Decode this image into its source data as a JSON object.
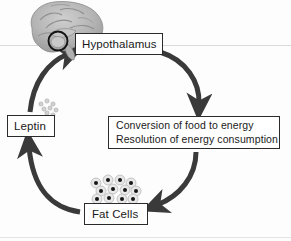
{
  "figure": {
    "credit": "© Cengage Learning"
  },
  "nodes": {
    "hypothalamus": {
      "label": "Hypothalamus"
    },
    "conversion": {
      "line1": "Conversion of food to energy",
      "line2": "Resolution of energy consumption"
    },
    "leptin": {
      "label": "Leptin"
    },
    "fat_cells": {
      "label": "Fat Cells"
    }
  },
  "illustrations": {
    "brain": "brain-sagittal-illustration",
    "hypothalamus_highlight": "circle-highlight-icon",
    "leptin_molecules": "leptin-dots-icon",
    "fat_cell_cluster": "fat-cells-cluster-icon"
  },
  "arrows": [
    {
      "id": "hypothalamus-to-conversion",
      "from": "Hypothalamus",
      "to": "Conversion of food to energy"
    },
    {
      "id": "conversion-to-fat-cells",
      "from": "Conversion of food to energy",
      "to": "Fat Cells"
    },
    {
      "id": "fat-cells-to-leptin",
      "from": "Fat Cells",
      "to": "Leptin"
    },
    {
      "id": "leptin-to-hypothalamus",
      "from": "Leptin",
      "to": "Hypothalamus"
    }
  ],
  "colors": {
    "arrow": "#3a3a3a",
    "box_border": "#2b2b2b",
    "text": "#1a1a1a",
    "credit_text": "#8c8c8c",
    "rule": "#d9d9d9",
    "fat_cell_fill": "#e8e8e8",
    "fat_cell_nucleus": "#1a1a1a"
  }
}
